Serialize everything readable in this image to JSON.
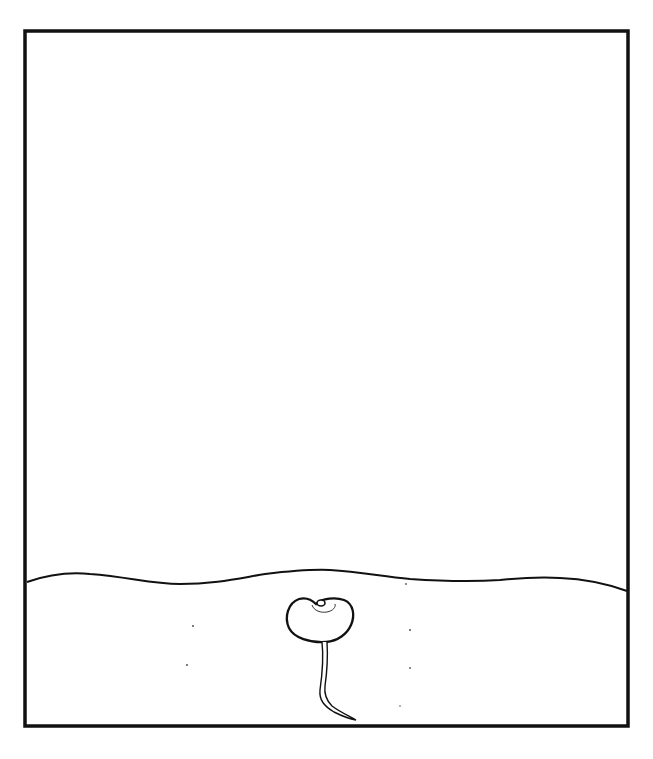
{
  "illustration": {
    "subject": "seed germinating in soil",
    "frame": {
      "x": 25,
      "y": 31,
      "width": 603,
      "height": 695,
      "stroke": "#111111",
      "stroke_width": 3.5
    },
    "soil_line": {
      "stroke": "#111111",
      "stroke_width": 2
    },
    "seed": {
      "stroke": "#111111",
      "fill": "#ffffff"
    },
    "background": "#ffffff"
  }
}
